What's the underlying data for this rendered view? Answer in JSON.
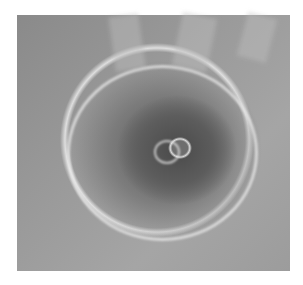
{
  "image": {
    "subject": "Olympus Mons volcano on Mars viewed from orbit (grayscale)",
    "colors": {
      "background": "#ffffff",
      "plains": "#9a9a9a",
      "summit_shadow": "#4a4a4a",
      "escarpment_highlight": "#e8e8e8"
    }
  }
}
